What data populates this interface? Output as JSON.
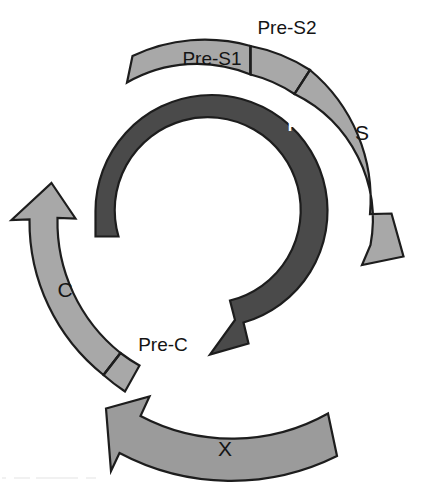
{
  "figure": {
    "name": "hbv-genome-orf-map",
    "type": "circular-genome-diagram",
    "background_color": "#ffffff",
    "outline_color": "#1d1d1d",
    "center": {
      "x": 211,
      "y": 221
    }
  },
  "palette": {
    "light_gray": "#a8a8a8",
    "mid_gray": "#9b9b9b",
    "dark_gray": "#4a4a4a",
    "outline": "#1d1d1d",
    "label_dark": "#141414",
    "label_light": "#ffffff"
  },
  "orfs": [
    {
      "id": "pre-s1",
      "label": "Pre-S1",
      "color": "#a8a8a8",
      "ring": "outer",
      "label_placement": "inside-band",
      "label_color": "#141414",
      "label_x": 212,
      "label_y": 65,
      "font_size": 19,
      "has_arrowhead": false,
      "tail_type": "flat-cut"
    },
    {
      "id": "pre-s2",
      "label": "Pre-S2",
      "color": "#a8a8a8",
      "ring": "outer",
      "label_placement": "outside-band",
      "label_color": "#141414",
      "label_x": 287,
      "label_y": 34,
      "font_size": 19,
      "has_arrowhead": false
    },
    {
      "id": "s",
      "label": "S",
      "color": "#a8a8a8",
      "ring": "outer",
      "label_placement": "inside-band",
      "label_color": "#141414",
      "label_x": 362,
      "label_y": 140,
      "font_size": 21,
      "has_arrowhead": true,
      "arrow_direction": "clockwise"
    },
    {
      "id": "p",
      "label": "P",
      "color": "#4a4a4a",
      "ring": "inner",
      "label_placement": "inside-band",
      "label_color": "#ffffff",
      "label_x": 293,
      "label_y": 131,
      "font_size": 16,
      "has_arrowhead": true,
      "arrow_direction": "clockwise",
      "tail_type": "flat-cut"
    },
    {
      "id": "pre-c",
      "label": "Pre-C",
      "color": "#a8a8a8",
      "ring": "outer",
      "label_placement": "outside-band",
      "label_color": "#141414",
      "label_x": 163,
      "label_y": 351,
      "font_size": 19,
      "has_arrowhead": false,
      "tail_type": "flat-cut"
    },
    {
      "id": "c",
      "label": "C",
      "color": "#a8a8a8",
      "ring": "outer",
      "label_placement": "inside-band",
      "label_color": "#141414",
      "label_x": 65,
      "label_y": 297,
      "font_size": 21,
      "has_arrowhead": true,
      "arrow_direction": "counterclockwise"
    },
    {
      "id": "x",
      "label": "X",
      "color": "#9b9b9b",
      "ring": "outer",
      "label_placement": "inside-band",
      "label_color": "#141414",
      "label_x": 225,
      "label_y": 456,
      "font_size": 21,
      "has_arrowhead": true,
      "arrow_direction": "counterclockwise"
    }
  ]
}
